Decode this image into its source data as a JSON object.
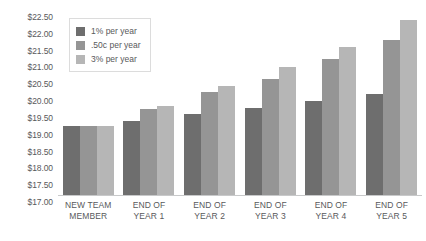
{
  "chart_data": {
    "type": "bar",
    "title": "",
    "subtitle": "",
    "xlabel": "",
    "ylabel": "",
    "grid": false,
    "legend_position": "top-left",
    "categories": [
      "NEW TEAM MEMBER",
      "END OF YEAR 1",
      "END OF YEAR 2",
      "END OF YEAR 3",
      "END OF YEAR 4",
      "END OF YEAR 5"
    ],
    "category_lines": [
      [
        "NEW TEAM",
        "MEMBER"
      ],
      [
        "END OF",
        "YEAR 1"
      ],
      [
        "END OF",
        "YEAR 2"
      ],
      [
        "END OF",
        "YEAR 3"
      ],
      [
        "END OF",
        "YEAR 4"
      ],
      [
        "END OF",
        "YEAR 5"
      ]
    ],
    "series": [
      {
        "name": "1% per year",
        "color": "#6e6e6e",
        "values": [
          19.05,
          19.2,
          19.4,
          19.6,
          19.8,
          20.0
        ]
      },
      {
        "name": ".50c per year",
        "color": "#959595",
        "values": [
          19.05,
          19.55,
          20.05,
          20.45,
          21.05,
          21.6
        ]
      },
      {
        "name": "3% per year",
        "color": "#b6b6b6",
        "values": [
          19.05,
          19.65,
          20.25,
          20.8,
          21.4,
          22.2
        ]
      }
    ],
    "ylim": [
      17.0,
      22.5
    ],
    "ytick_values": [
      22.5,
      22.0,
      21.5,
      21.0,
      20.5,
      20.0,
      19.5,
      19.0,
      18.5,
      18.0,
      17.5,
      17.0
    ],
    "ytick_labels": [
      "$22.50",
      "$22.00",
      "$21.50",
      "$21.00",
      "$20.50",
      "$20.00",
      "$19.50",
      "$19.00",
      "$18.50",
      "$18.00",
      "$17.50",
      "$17.00"
    ]
  },
  "legend": {
    "items": [
      {
        "label": "1% per year",
        "color": "#6e6e6e"
      },
      {
        "label": ".50c per year",
        "color": "#959595"
      },
      {
        "label": "3% per year",
        "color": "#b6b6b6"
      }
    ]
  },
  "colors": {
    "series_1": "#6e6e6e",
    "series_2": "#959595",
    "series_3": "#b6b6b6",
    "axis": "#c8c9ca",
    "text": "#58595b",
    "background": "#ffffff"
  }
}
